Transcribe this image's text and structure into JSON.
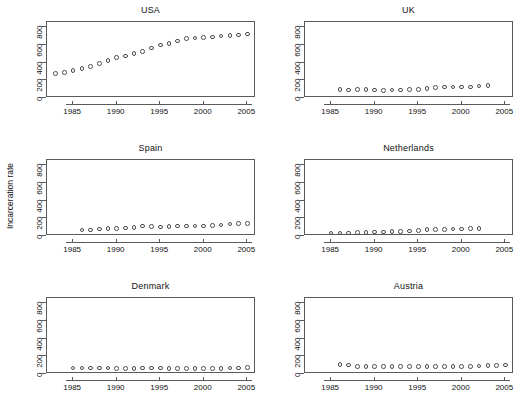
{
  "figure": {
    "ylabel": "Incarceration rate",
    "axis": {
      "yticks": [
        0,
        200,
        400,
        600,
        800
      ],
      "ytick_labels": [
        "0",
        "200",
        "400",
        "600",
        "800"
      ],
      "xticks": [
        1985,
        1990,
        1995,
        2000,
        2005
      ],
      "xtick_labels": [
        "1985",
        "1990",
        "1995",
        "2000",
        "2005"
      ],
      "xlim": [
        1982,
        2006
      ],
      "ylim": [
        0,
        860
      ]
    },
    "marker_color": "#4d4d4d",
    "frame_color": "#5a5a5a"
  },
  "chart_data": [
    {
      "type": "scatter",
      "title": "USA",
      "xlabel": "",
      "ylabel": "Incarceration rate",
      "xlim": [
        1982,
        2006
      ],
      "ylim": [
        0,
        860
      ],
      "x": [
        1983,
        1984,
        1985,
        1986,
        1987,
        1988,
        1989,
        1990,
        1991,
        1992,
        1993,
        1994,
        1995,
        1996,
        1997,
        1998,
        1999,
        2000,
        2001,
        2002,
        2003,
        2004,
        2005
      ],
      "values": [
        275,
        288,
        312,
        333,
        355,
        390,
        425,
        455,
        477,
        505,
        525,
        565,
        600,
        620,
        645,
        670,
        680,
        683,
        690,
        700,
        705,
        715,
        725
      ]
    },
    {
      "type": "scatter",
      "title": "UK",
      "xlabel": "",
      "ylabel": "",
      "xlim": [
        1982,
        2006
      ],
      "ylim": [
        0,
        860
      ],
      "x": [
        1986,
        1987,
        1988,
        1989,
        1990,
        1991,
        1992,
        1993,
        1994,
        1995,
        1996,
        1997,
        1998,
        1999,
        2000,
        2001,
        2002,
        2003
      ],
      "values": [
        97,
        92,
        97,
        97,
        90,
        88,
        89,
        89,
        94,
        99,
        106,
        117,
        125,
        125,
        124,
        126,
        137,
        141
      ]
    },
    {
      "type": "scatter",
      "title": "Spain",
      "xlabel": "",
      "ylabel": "Incarceration rate",
      "xlim": [
        1982,
        2006
      ],
      "ylim": [
        0,
        860
      ],
      "x": [
        1986,
        1987,
        1988,
        1989,
        1990,
        1991,
        1992,
        1993,
        1994,
        1995,
        1996,
        1997,
        1998,
        1999,
        2000,
        2001,
        2002,
        2003,
        2004,
        2005
      ],
      "values": [
        67,
        68,
        77,
        83,
        87,
        92,
        96,
        114,
        110,
        103,
        110,
        113,
        114,
        113,
        114,
        117,
        126,
        138,
        140,
        142
      ]
    },
    {
      "type": "scatter",
      "title": "Netherlands",
      "xlabel": "",
      "ylabel": "",
      "xlim": [
        1982,
        2006
      ],
      "ylim": [
        0,
        860
      ],
      "x": [
        1985,
        1986,
        1987,
        1988,
        1989,
        1990,
        1991,
        1992,
        1993,
        1994,
        1995,
        1996,
        1997,
        1998,
        1999,
        2000,
        2001,
        2002
      ],
      "values": [
        33,
        35,
        36,
        38,
        40,
        44,
        46,
        49,
        52,
        55,
        63,
        71,
        75,
        76,
        79,
        80,
        82,
        85
      ]
    },
    {
      "type": "scatter",
      "title": "Denmark",
      "xlabel": "",
      "ylabel": "",
      "xlim": [
        1982,
        2006
      ],
      "ylim": [
        0,
        860
      ],
      "x": [
        1985,
        1986,
        1987,
        1988,
        1989,
        1990,
        1991,
        1992,
        1993,
        1994,
        1995,
        1996,
        1997,
        1998,
        1999,
        2000,
        2001,
        2002,
        2003,
        2004,
        2005
      ],
      "values": [
        67,
        66,
        66,
        68,
        67,
        64,
        65,
        65,
        69,
        70,
        67,
        63,
        62,
        64,
        63,
        60,
        59,
        62,
        68,
        70,
        73
      ]
    },
    {
      "type": "scatter",
      "title": "Austria",
      "xlabel": "",
      "ylabel": "",
      "xlim": [
        1982,
        2006
      ],
      "ylim": [
        0,
        860
      ],
      "x": [
        1986,
        1987,
        1988,
        1989,
        1990,
        1991,
        1992,
        1993,
        1994,
        1995,
        1996,
        1997,
        1998,
        1999,
        2000,
        2001,
        2002,
        2003,
        2004,
        2005
      ],
      "values": [
        108,
        103,
        88,
        83,
        83,
        84,
        83,
        88,
        85,
        82,
        82,
        82,
        83,
        83,
        85,
        85,
        89,
        95,
        98,
        100
      ]
    }
  ]
}
